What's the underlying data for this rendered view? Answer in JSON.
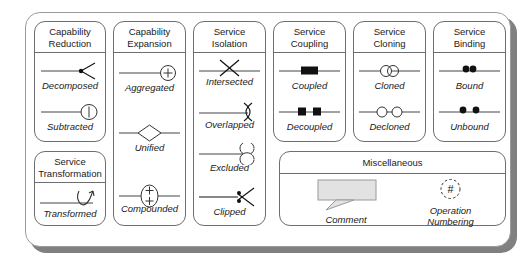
{
  "diagram": {
    "colors": {
      "stroke": "#6e6e6e",
      "text": "#1a1a1a",
      "shadow": "#808080",
      "symbol": "#111111",
      "comment_fill": "#e2e2e2",
      "background": "#ffffff"
    },
    "panels": [
      {
        "id": "capability-reduction",
        "title": "Capability\nReduction",
        "entries": [
          {
            "label": "Decomposed",
            "icon": "decomposed-symbol"
          },
          {
            "label": "Subtracted",
            "icon": "subtracted-symbol"
          }
        ]
      },
      {
        "id": "capability-expansion",
        "title": "Capability\nExpansion",
        "entries": [
          {
            "label": "Aggregated",
            "icon": "aggregated-symbol"
          },
          {
            "label": "Unified",
            "icon": "unified-symbol"
          },
          {
            "label": "Compounded",
            "icon": "compounded-symbol"
          }
        ]
      },
      {
        "id": "service-isolation",
        "title": "Service\nIsolation",
        "entries": [
          {
            "label": "Intersected",
            "icon": "intersected-symbol"
          },
          {
            "label": "Overlapped",
            "icon": "overlapped-symbol"
          },
          {
            "label": "Excluded",
            "icon": "excluded-symbol"
          },
          {
            "label": "Clipped",
            "icon": "clipped-symbol"
          }
        ]
      },
      {
        "id": "service-coupling",
        "title": "Service\nCoupling",
        "entries": [
          {
            "label": "Coupled",
            "icon": "coupled-symbol"
          },
          {
            "label": "Decoupled",
            "icon": "decoupled-symbol"
          }
        ]
      },
      {
        "id": "service-cloning",
        "title": "Service\nCloning",
        "entries": [
          {
            "label": "Cloned",
            "icon": "cloned-symbol"
          },
          {
            "label": "Decloned",
            "icon": "decloned-symbol"
          }
        ]
      },
      {
        "id": "service-binding",
        "title": "Service\nBinding",
        "entries": [
          {
            "label": "Bound",
            "icon": "bound-symbol"
          },
          {
            "label": "Unbound",
            "icon": "unbound-symbol"
          }
        ]
      },
      {
        "id": "service-transformation",
        "title": "Service\nTransformation",
        "entries": [
          {
            "label": "Transformed",
            "icon": "transformed-symbol"
          }
        ]
      },
      {
        "id": "miscellaneous",
        "title": "Miscellaneous",
        "entries": [
          {
            "label": "Comment",
            "icon": "comment-bubble-symbol"
          },
          {
            "label": "Operation\nNumbering",
            "icon": "operation-numbering-symbol",
            "glyph": "#"
          }
        ]
      }
    ]
  }
}
